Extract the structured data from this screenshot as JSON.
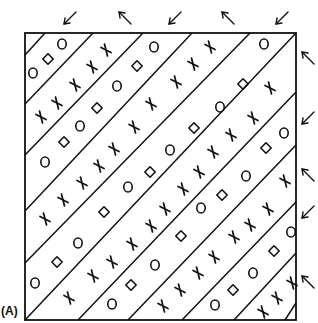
{
  "figure": {
    "panel_label": "(A)",
    "colors": {
      "ink": "#111111",
      "background": "#ffffff"
    },
    "frame": {
      "x1": 25,
      "y1": 33,
      "x2": 296,
      "y2": 320
    },
    "band_lines": [
      [
        45,
        33,
        25,
        55
      ],
      [
        93,
        33,
        25,
        104
      ],
      [
        143,
        33,
        25,
        155
      ],
      [
        192,
        33,
        25,
        211
      ],
      [
        250,
        33,
        25,
        263
      ],
      [
        296,
        33,
        25,
        320
      ],
      [
        296,
        92,
        78,
        320
      ],
      [
        296,
        145,
        128,
        320
      ],
      [
        296,
        202,
        182,
        320
      ],
      [
        296,
        253,
        234,
        320
      ],
      [
        296,
        303,
        285,
        320
      ]
    ],
    "arrows": [
      {
        "name": "top-arrow-1",
        "dir": "down-left",
        "x": 70,
        "y": 18
      },
      {
        "name": "top-arrow-2",
        "dir": "up-left",
        "x": 125,
        "y": 18
      },
      {
        "name": "top-arrow-3",
        "dir": "down-left",
        "x": 175,
        "y": 18
      },
      {
        "name": "top-arrow-4",
        "dir": "up-left",
        "x": 228,
        "y": 18
      },
      {
        "name": "top-arrow-5",
        "dir": "down-left",
        "x": 282,
        "y": 18
      },
      {
        "name": "right-arrow-1",
        "dir": "up-left",
        "x": 308,
        "y": 58
      },
      {
        "name": "right-arrow-2",
        "dir": "down-left",
        "x": 308,
        "y": 118
      },
      {
        "name": "right-arrow-3",
        "dir": "up-left",
        "x": 308,
        "y": 175
      },
      {
        "name": "right-arrow-4",
        "dir": "down-left",
        "x": 308,
        "y": 212
      },
      {
        "name": "right-arrow-5",
        "dir": "up-left",
        "x": 308,
        "y": 282
      }
    ],
    "symbols": [
      {
        "t": "circle",
        "x": 33,
        "y": 73
      },
      {
        "t": "diamond",
        "x": 48,
        "y": 59
      },
      {
        "t": "circle",
        "x": 62,
        "y": 44
      },
      {
        "t": "cross",
        "x": 41,
        "y": 117
      },
      {
        "t": "cross",
        "x": 57,
        "y": 103
      },
      {
        "t": "cross",
        "x": 75,
        "y": 85
      },
      {
        "t": "cross",
        "x": 92,
        "y": 67
      },
      {
        "t": "cross",
        "x": 106,
        "y": 50
      },
      {
        "t": "circle",
        "x": 45,
        "y": 162
      },
      {
        "t": "diamond",
        "x": 64,
        "y": 142
      },
      {
        "t": "circle",
        "x": 80,
        "y": 126
      },
      {
        "t": "diamond",
        "x": 97,
        "y": 108
      },
      {
        "t": "circle",
        "x": 117,
        "y": 86
      },
      {
        "t": "diamond",
        "x": 137,
        "y": 66
      },
      {
        "t": "circle",
        "x": 154,
        "y": 47
      },
      {
        "t": "cross",
        "x": 45,
        "y": 219
      },
      {
        "t": "cross",
        "x": 63,
        "y": 200
      },
      {
        "t": "cross",
        "x": 82,
        "y": 183
      },
      {
        "t": "cross",
        "x": 99,
        "y": 166
      },
      {
        "t": "cross",
        "x": 114,
        "y": 149
      },
      {
        "t": "cross",
        "x": 134,
        "y": 127
      },
      {
        "t": "cross",
        "x": 151,
        "y": 104
      },
      {
        "t": "cross",
        "x": 176,
        "y": 82
      },
      {
        "t": "cross",
        "x": 193,
        "y": 64
      },
      {
        "t": "cross",
        "x": 210,
        "y": 47
      },
      {
        "t": "circle",
        "x": 35,
        "y": 283
      },
      {
        "t": "diamond",
        "x": 57,
        "y": 262
      },
      {
        "t": "circle",
        "x": 78,
        "y": 243
      },
      {
        "t": "diamond",
        "x": 104,
        "y": 212
      },
      {
        "t": "circle",
        "x": 128,
        "y": 187
      },
      {
        "t": "diamond",
        "x": 150,
        "y": 172
      },
      {
        "t": "circle",
        "x": 170,
        "y": 150
      },
      {
        "t": "diamond",
        "x": 194,
        "y": 128
      },
      {
        "t": "circle",
        "x": 220,
        "y": 107
      },
      {
        "t": "diamond",
        "x": 243,
        "y": 84
      },
      {
        "t": "circle",
        "x": 264,
        "y": 44
      },
      {
        "t": "cross",
        "x": 69,
        "y": 298
      },
      {
        "t": "cross",
        "x": 93,
        "y": 276
      },
      {
        "t": "cross",
        "x": 112,
        "y": 262
      },
      {
        "t": "cross",
        "x": 132,
        "y": 244
      },
      {
        "t": "cross",
        "x": 151,
        "y": 226
      },
      {
        "t": "cross",
        "x": 165,
        "y": 209
      },
      {
        "t": "cross",
        "x": 183,
        "y": 189
      },
      {
        "t": "cross",
        "x": 199,
        "y": 172
      },
      {
        "t": "cross",
        "x": 213,
        "y": 152
      },
      {
        "t": "cross",
        "x": 231,
        "y": 135
      },
      {
        "t": "cross",
        "x": 253,
        "y": 118
      },
      {
        "t": "cross",
        "x": 270,
        "y": 88
      },
      {
        "t": "circle",
        "x": 112,
        "y": 304
      },
      {
        "t": "diamond",
        "x": 131,
        "y": 285
      },
      {
        "t": "circle",
        "x": 155,
        "y": 265
      },
      {
        "t": "diamond",
        "x": 181,
        "y": 236
      },
      {
        "t": "circle",
        "x": 201,
        "y": 208
      },
      {
        "t": "diamond",
        "x": 222,
        "y": 195
      },
      {
        "t": "circle",
        "x": 246,
        "y": 176
      },
      {
        "t": "diamond",
        "x": 266,
        "y": 148
      },
      {
        "t": "circle",
        "x": 284,
        "y": 133
      },
      {
        "t": "cross",
        "x": 163,
        "y": 306
      },
      {
        "t": "cross",
        "x": 180,
        "y": 290
      },
      {
        "t": "cross",
        "x": 198,
        "y": 273
      },
      {
        "t": "cross",
        "x": 214,
        "y": 257
      },
      {
        "t": "cross",
        "x": 234,
        "y": 237
      },
      {
        "t": "cross",
        "x": 250,
        "y": 225
      },
      {
        "t": "cross",
        "x": 268,
        "y": 209
      },
      {
        "t": "cross",
        "x": 285,
        "y": 181
      },
      {
        "t": "circle",
        "x": 215,
        "y": 305
      },
      {
        "t": "diamond",
        "x": 233,
        "y": 290
      },
      {
        "t": "circle",
        "x": 253,
        "y": 273
      },
      {
        "t": "diamond",
        "x": 274,
        "y": 251
      },
      {
        "t": "circle",
        "x": 291,
        "y": 232
      },
      {
        "t": "cross",
        "x": 263,
        "y": 312
      },
      {
        "t": "cross",
        "x": 277,
        "y": 298
      },
      {
        "t": "cross",
        "x": 292,
        "y": 283
      }
    ]
  }
}
